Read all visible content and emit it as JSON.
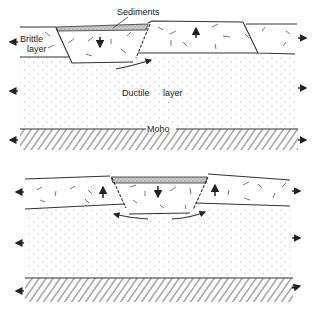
{
  "diagram": {
    "type": "cross-section",
    "panels": [
      {
        "id": "top",
        "stage": "graben formation in brittle upper layer",
        "labels": {
          "sediments": "Sediments",
          "brittle_line1": "Brittle",
          "brittle_line2": "layer",
          "ductile": "Ductile",
          "ductile2": "layer",
          "moho": "Moho"
        },
        "block_motions": [
          "down (central graben)",
          "up (right block)"
        ],
        "extension": "outward arrows on both sides"
      },
      {
        "id": "bottom",
        "stage": "graben with flanking uplifted shoulders and ductile flow",
        "block_motions": [
          "up (left shoulder)",
          "down (central graben)",
          "up (right shoulder)"
        ],
        "extension": "outward arrows on both sides"
      }
    ],
    "colors": {
      "line": "#333333",
      "sediment_fill": "#bdbdbd",
      "ductile_dot": "#9a9a9a",
      "background": "#ffffff"
    }
  }
}
